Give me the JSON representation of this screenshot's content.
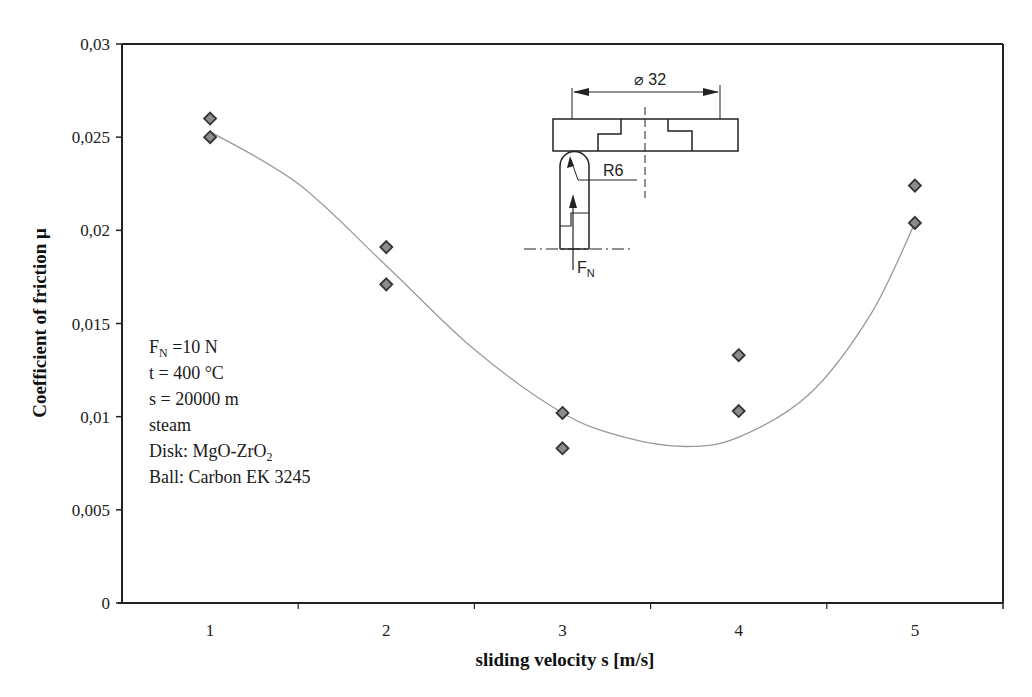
{
  "chart_data": {
    "type": "scatter",
    "title": "",
    "xlabel": "sliding velocity s [m/s]",
    "ylabel": "Coefficient of friction μ",
    "categories": [
      "1",
      "2",
      "3",
      "4",
      "5"
    ],
    "x_ticks": [
      "1",
      "2",
      "3",
      "4",
      "5"
    ],
    "y_ticks": [
      "0",
      "0,005",
      "0,01",
      "0,015",
      "0,02",
      "0,025",
      "0,03"
    ],
    "ylim": [
      0,
      0.03
    ],
    "grid": false,
    "legend": "none",
    "series": [
      {
        "name": "measurements",
        "marker": "diamond",
        "color": "#8c8c8c",
        "points": [
          {
            "x": 1,
            "y": 0.026
          },
          {
            "x": 1,
            "y": 0.025
          },
          {
            "x": 2,
            "y": 0.0191
          },
          {
            "x": 2,
            "y": 0.0171
          },
          {
            "x": 3,
            "y": 0.0102
          },
          {
            "x": 3,
            "y": 0.0083
          },
          {
            "x": 4,
            "y": 0.0133
          },
          {
            "x": 4,
            "y": 0.0103
          },
          {
            "x": 5,
            "y": 0.0224
          },
          {
            "x": 5,
            "y": 0.0204
          }
        ]
      },
      {
        "name": "trend",
        "type": "line",
        "color": "#9a9a9a",
        "points": [
          {
            "x": 1,
            "y": 0.0253
          },
          {
            "x": 1.5,
            "y": 0.0225
          },
          {
            "x": 2,
            "y": 0.0181
          },
          {
            "x": 2.5,
            "y": 0.0136
          },
          {
            "x": 3,
            "y": 0.0102
          },
          {
            "x": 3.35,
            "y": 0.0089
          },
          {
            "x": 3.7,
            "y": 0.0084
          },
          {
            "x": 4,
            "y": 0.0089
          },
          {
            "x": 4.4,
            "y": 0.0112
          },
          {
            "x": 4.75,
            "y": 0.0155
          },
          {
            "x": 5,
            "y": 0.0204
          }
        ]
      }
    ],
    "annotations": [
      {
        "main": "F",
        "sub": "N",
        "rest": " =10 N"
      },
      {
        "main": "t = 400 °C"
      },
      {
        "main": "s = 20000 m"
      },
      {
        "main": "steam"
      },
      {
        "main": "Disk: MgO-ZrO",
        "sub": "2"
      },
      {
        "main": "Ball: Carbon EK 3245"
      }
    ]
  },
  "diagram": {
    "diameter_label": "⌀ 32",
    "radius_label": "R6",
    "force_label_main": "F",
    "force_label_sub": "N"
  }
}
